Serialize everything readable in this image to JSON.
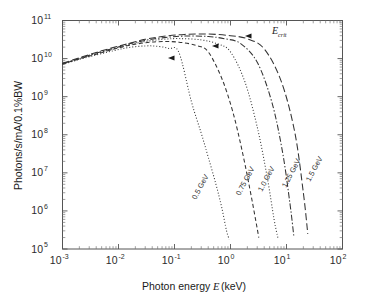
{
  "chart_data": {
    "type": "line",
    "title": "",
    "xlabel": "Photon energy E (keV)",
    "ylabel": "Photons/s/mA/0.1%BW",
    "xscale": "log",
    "yscale": "log",
    "xlim": [
      0.001,
      100
    ],
    "ylim": [
      100000,
      100000000000
    ],
    "grid": false,
    "legend_position": "inline-curve-labels",
    "xtick_labels": [
      "10-3",
      "10-2",
      "10-1",
      "100",
      "101",
      "102"
    ],
    "xtick_bases": [
      "10",
      "10",
      "10",
      "10",
      "10",
      "10"
    ],
    "xtick_exponents": [
      "-3",
      "-2",
      "-1",
      "0",
      "1",
      "2"
    ],
    "ytick_bases": [
      "10",
      "10",
      "10",
      "10",
      "10",
      "10",
      "10"
    ],
    "ytick_exponents": [
      "5",
      "6",
      "7",
      "8",
      "9",
      "10",
      "11"
    ],
    "annotations": [
      {
        "text_main": "E",
        "text_sub": "crit",
        "x_px": 272,
        "y_px": 34,
        "name": "e-crit-annotation"
      }
    ],
    "series": [
      {
        "name": "0.5 GeV",
        "label": "0.5 GeV",
        "linestyle": "dotted",
        "color": "#333333",
        "critical_energy_keV": 0.12,
        "x": [
          0.001,
          0.002,
          0.004,
          0.008,
          0.015,
          0.03,
          0.05,
          0.08,
          0.12,
          0.2,
          0.3,
          0.4,
          0.55,
          0.7,
          0.85,
          0.95
        ],
        "y": [
          7000000000.0,
          9500000000.0,
          12500000000.0,
          16000000000.0,
          19500000000.0,
          21500000000.0,
          21000000000.0,
          18500000000.0,
          14500000000.0,
          750000000.0,
          110000000.0,
          26000000.0,
          5000000.0,
          1200000.0,
          300000.0,
          180000.0
        ]
      },
      {
        "name": "0.75 GeV",
        "label": "0.75 GeV",
        "linestyle": "dashed",
        "color": "#333333",
        "critical_energy_keV": 0.4,
        "x": [
          0.001,
          0.002,
          0.004,
          0.008,
          0.015,
          0.03,
          0.06,
          0.12,
          0.25,
          0.4,
          0.7,
          1.1,
          1.6,
          2.2,
          2.8,
          3.2
        ],
        "y": [
          7200000000.0,
          9800000000.0,
          13000000000.0,
          17500000000.0,
          22000000000.0,
          26000000000.0,
          28000000000.0,
          27000000000.0,
          22000000000.0,
          15000000000.0,
          3000000000.0,
          400000000.0,
          40000000.0,
          4000000.0,
          600000.0,
          200000.0
        ]
      },
      {
        "name": "1.0 GeV",
        "label": "1.0 GeV",
        "linestyle": "dotted",
        "color": "#333333",
        "critical_energy_keV": 0.95,
        "x": [
          0.001,
          0.002,
          0.004,
          0.008,
          0.015,
          0.03,
          0.06,
          0.12,
          0.3,
          0.6,
          1.0,
          1.8,
          3.0,
          4.5,
          6.0,
          7.0
        ],
        "y": [
          7300000000.0,
          10000000000.0,
          13500000000.0,
          18000000000.0,
          23000000000.0,
          28000000000.0,
          32000000000.0,
          33500000000.0,
          31000000000.0,
          24000000000.0,
          15000000000.0,
          2500000000.0,
          160000000.0,
          8000000.0,
          600000.0,
          200000.0
        ]
      },
      {
        "name": "1.25 GeV",
        "label": "1.25 GeV",
        "linestyle": "dashdot",
        "color": "#333333",
        "critical_energy_keV": 1.85,
        "x": [
          0.001,
          0.002,
          0.004,
          0.008,
          0.015,
          0.03,
          0.06,
          0.15,
          0.4,
          0.8,
          1.5,
          3.0,
          5.5,
          8.5,
          11.5,
          13.5
        ],
        "y": [
          7400000000.0,
          10000000000.0,
          14000000000.0,
          18500000000.0,
          24000000000.0,
          30000000000.0,
          35000000000.0,
          39000000000.0,
          38000000000.0,
          33000000000.0,
          25000000000.0,
          8000000000.0,
          700000000.0,
          35000000.0,
          1600000.0,
          220000.0
        ]
      },
      {
        "name": "1.5 GeV",
        "label": "1.5 GeV",
        "linestyle": "longdash",
        "color": "#333333",
        "critical_energy_keV": 3.2,
        "x": [
          0.001,
          0.002,
          0.004,
          0.008,
          0.015,
          0.03,
          0.06,
          0.15,
          0.4,
          1.0,
          2.0,
          4.0,
          8.0,
          14.0,
          20.0,
          24.0
        ],
        "y": [
          7500000000.0,
          10500000000.0,
          14500000000.0,
          19500000000.0,
          25000000000.0,
          32000000000.0,
          38000000000.0,
          43000000000.0,
          44000000000.0,
          40000000000.0,
          33000000000.0,
          18000000000.0,
          2600000000.0,
          120000000.0,
          3000000.0,
          250000.0
        ]
      }
    ],
    "curve_labels": [
      {
        "text": "0.5 GeV",
        "x_px": 196,
        "y_px": 200,
        "rotate": -62
      },
      {
        "text": "0.75 GeV",
        "x_px": 240,
        "y_px": 196,
        "rotate": -62
      },
      {
        "text": "1.0 GeV",
        "x_px": 262,
        "y_px": 192,
        "rotate": -62
      },
      {
        "text": "1.25 GeV",
        "x_px": 286,
        "y_px": 188,
        "rotate": -62
      },
      {
        "text": "1.5 GeV",
        "x_px": 310,
        "y_px": 182,
        "rotate": -62
      }
    ],
    "arrow_markers": [
      {
        "x_px": 168,
        "y_px": 58
      },
      {
        "x_px": 212,
        "y_px": 46
      },
      {
        "x_px": 245,
        "y_px": 36
      }
    ]
  },
  "figure": {
    "background_color": "#ffffff",
    "axis_color": "#555555",
    "curve_color": "#333333"
  }
}
